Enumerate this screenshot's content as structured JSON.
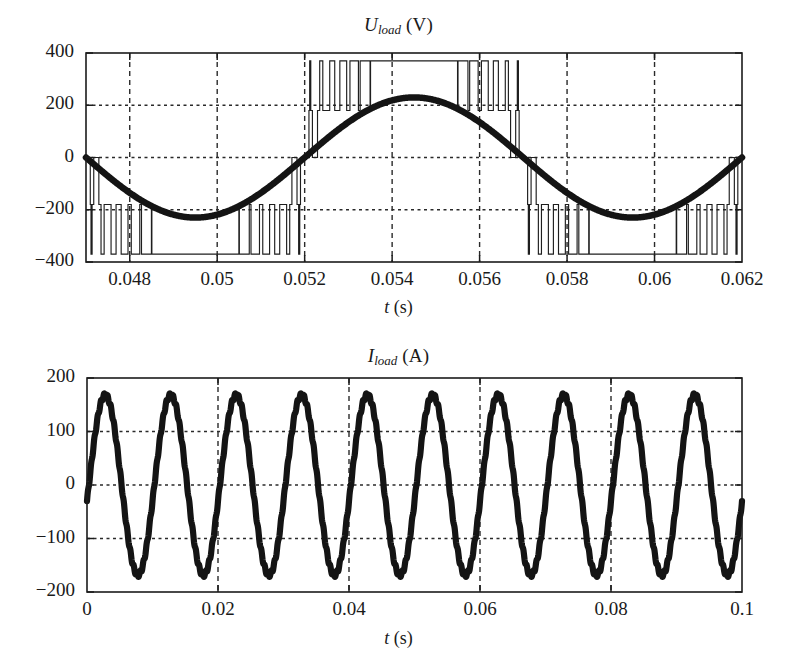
{
  "figure": {
    "background": "#ffffff",
    "ink": "#1a1a1a"
  },
  "chart_data": [
    {
      "id": "voltage",
      "type": "line",
      "title": "U_load (V)",
      "title_symbol": "U",
      "title_subscript": "load",
      "title_unit": "(V)",
      "xlabel": "t (s)",
      "xlabel_symbol": "t",
      "xlabel_unit": "(s)",
      "ylabel": "",
      "xlim": [
        0.047,
        0.062
      ],
      "ylim": [
        -400,
        400
      ],
      "xticks": [
        0.048,
        0.05,
        0.052,
        0.054,
        0.056,
        0.058,
        0.06,
        0.062
      ],
      "xticklabels": [
        "0.048",
        "0.05",
        "0.052",
        "0.054",
        "0.056",
        "0.058",
        "0.06",
        "0.062"
      ],
      "yticks": [
        -400,
        -200,
        0,
        200,
        400
      ],
      "yticklabels": [
        "−400",
        "−200",
        "0",
        "200",
        "400"
      ],
      "grid": {
        "vertical": [
          0.048,
          0.05,
          0.052,
          0.054,
          0.056,
          0.058,
          0.06
        ],
        "horizontal": [
          -200,
          0,
          200
        ],
        "vertical_style": "dashed",
        "horizontal_style": "dotted"
      },
      "legend": "none",
      "series": [
        {
          "name": "PWM inverter output voltage",
          "style": "pwm",
          "description": "Multilevel PWM switched waveform, carrier frequency ~2 kHz, levels near 0, +-180 V and +-370 V",
          "carrier_frequency_hz": 2000,
          "levels": [
            0,
            180,
            370,
            -180,
            -370
          ],
          "amplitude_peak": 370
        },
        {
          "name": "Fundamental load voltage",
          "style": "thick-smooth",
          "description": "50 Hz fundamental sinusoid riding within the PWM envelope",
          "fundamental_frequency_hz": 100,
          "amplitude": 230,
          "phase_shift_s": 0.0545,
          "peak_value": 230,
          "trough_value": -225
        }
      ]
    },
    {
      "id": "current",
      "type": "line",
      "title": "I_load (A)",
      "title_symbol": "I",
      "title_subscript": "load",
      "title_unit": "(A)",
      "xlabel": "t (s)",
      "xlabel_symbol": "t",
      "xlabel_unit": "(s)",
      "ylabel": "",
      "xlim": [
        0,
        0.1
      ],
      "ylim": [
        -200,
        200
      ],
      "xticks": [
        0,
        0.02,
        0.04,
        0.06,
        0.08,
        0.1
      ],
      "xticklabels": [
        "0",
        "0.02",
        "0.04",
        "0.06",
        "0.08",
        "0.1"
      ],
      "yticks": [
        -200,
        -100,
        0,
        100,
        200
      ],
      "yticklabels": [
        "−200",
        "−100",
        "0",
        "100",
        "200"
      ],
      "grid": {
        "vertical": [
          0.02,
          0.04,
          0.06,
          0.08
        ],
        "horizontal": [
          -100,
          0,
          100
        ],
        "vertical_style": "dashed",
        "horizontal_style": "dotted"
      },
      "legend": "none",
      "series": [
        {
          "name": "Load current",
          "style": "thick-ripple",
          "description": "Near sinusoidal 100 Hz load current with small switching ripple, 10 cycles shown",
          "frequency_hz": 100,
          "cycles_shown": 10,
          "amplitude": 168,
          "peak_value": 170,
          "trough_value": -165,
          "start_value": -30,
          "ripple_amplitude": 4
        }
      ]
    }
  ]
}
